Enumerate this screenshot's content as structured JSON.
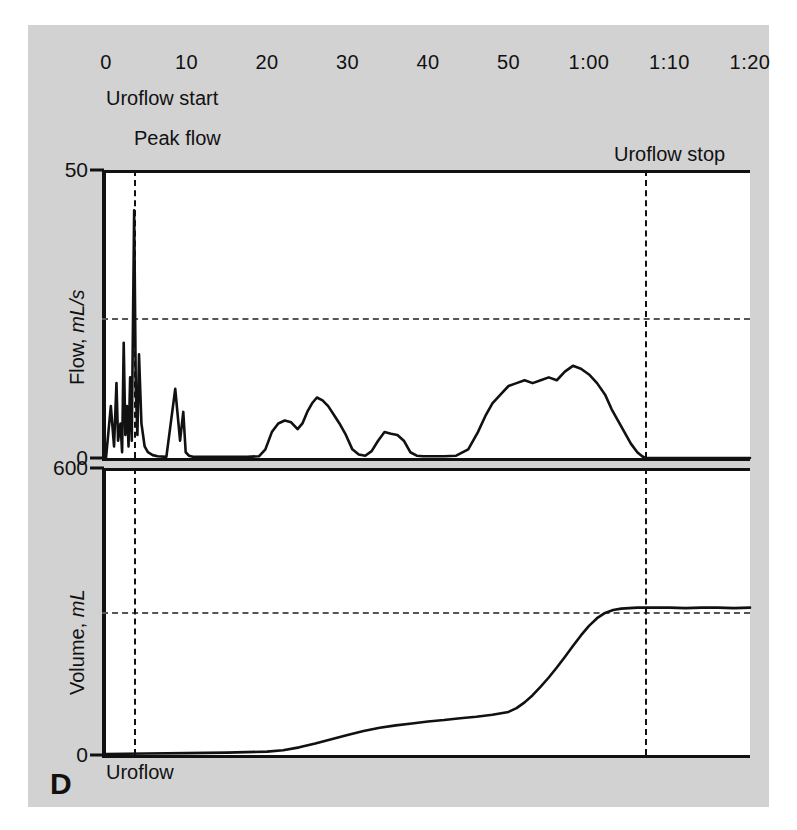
{
  "figure": {
    "panel_label": "D",
    "caption": "Uroflow",
    "background": "#d2d2d2",
    "plot_background": "#ffffff",
    "trace_color": "#111111"
  },
  "annotations": [
    {
      "name": "uroflow-start",
      "text": "Uroflow start",
      "time_s": 0
    },
    {
      "name": "peak-flow",
      "text": "Peak flow",
      "time_s": 3.5
    },
    {
      "name": "uroflow-stop",
      "text": "Uroflow stop",
      "time_s": 67
    }
  ],
  "chart_data": {
    "type": "line",
    "title": "Uroflow",
    "panel": "D",
    "xlabel": "",
    "x_tick_labels": [
      "0",
      "10",
      "20",
      "30",
      "40",
      "50",
      "1:00",
      "1:10",
      "1:20"
    ],
    "x_tick_values": [
      0,
      10,
      20,
      30,
      40,
      50,
      60,
      70,
      80
    ],
    "xlim": [
      0,
      80
    ],
    "grid": true,
    "legend": "none",
    "subplots": [
      {
        "name": "flow",
        "ylabel": "Flow, mL/s",
        "ylim": [
          0,
          50
        ],
        "y_tick_labels": [
          "50",
          "0"
        ],
        "y_tick_values": [
          50,
          0
        ],
        "gridlines_y": [
          25
        ],
        "units": "mL/s",
        "peak_flow_value": 43,
        "peak_flow_time_s": 3.5,
        "series": [
          {
            "name": "flow-rate",
            "x": [
              0,
              0.6,
              1.0,
              1.3,
              1.5,
              1.8,
              2.0,
              2.2,
              2.4,
              2.6,
              2.8,
              3.0,
              3.2,
              3.4,
              3.5,
              3.7,
              3.9,
              4.1,
              4.4,
              4.8,
              5.2,
              5.8,
              6.4,
              7.5,
              8.6,
              9.2,
              9.6,
              9.9,
              10.3,
              10.8,
              11.6,
              13.0,
              15.0,
              17.5,
              19.0,
              19.8,
              20.6,
              21.4,
              22.2,
              23.0,
              23.8,
              24.4,
              25.0,
              25.6,
              26.2,
              26.9,
              27.6,
              28.3,
              29.0,
              29.8,
              30.6,
              31.4,
              32.2,
              33.0,
              33.8,
              34.6,
              35.4,
              36.2,
              37.0,
              37.8,
              38.6,
              39.4,
              40.2,
              41.0,
              42.0,
              43.5,
              45.0,
              46.2,
              47.2,
              48.0,
              49.0,
              50.0,
              51.0,
              52.0,
              53.0,
              54.0,
              55.0,
              56.0,
              57.0,
              58.0,
              59.0,
              60.0,
              61.0,
              62.0,
              62.8,
              63.6,
              64.4,
              65.2,
              66.0,
              66.6,
              67.0,
              70.0,
              75.0,
              80.0
            ],
            "y": [
              0,
              9,
              2,
              13,
              3,
              6,
              1,
              20,
              4,
              9,
              2,
              14,
              3,
              30,
              43,
              12,
              4,
              18,
              6,
              2,
              1,
              0.5,
              0.3,
              0.2,
              12,
              3,
              8,
              1,
              0.4,
              0.2,
              0.2,
              0.2,
              0.2,
              0.2,
              0.3,
              1.5,
              4.5,
              6.0,
              6.5,
              6.2,
              5.0,
              6.0,
              8.0,
              9.5,
              10.5,
              10.0,
              9.0,
              7.5,
              6.0,
              4.0,
              1.5,
              0.6,
              0.4,
              1.2,
              3.0,
              4.5,
              4.2,
              4.0,
              3.0,
              1.0,
              0.4,
              0.3,
              0.3,
              0.3,
              0.3,
              0.4,
              1.5,
              4.5,
              7.5,
              9.5,
              11.0,
              12.5,
              13.0,
              13.5,
              13.0,
              13.5,
              14.0,
              13.5,
              15.0,
              16.0,
              15.5,
              14.5,
              13.0,
              11.0,
              8.5,
              6.5,
              4.5,
              2.5,
              1.0,
              0.3,
              0,
              0,
              0,
              0
            ]
          }
        ]
      },
      {
        "name": "volume",
        "ylabel": "Volume, mL",
        "ylim": [
          0,
          600
        ],
        "y_tick_labels": [
          "600",
          "0"
        ],
        "y_tick_values": [
          600,
          0
        ],
        "gridlines_y": [
          300
        ],
        "units": "mL",
        "voided_volume": 305,
        "series": [
          {
            "name": "voided-volume",
            "x": [
              0,
              5,
              10,
              15,
              20,
              22,
              24,
              26,
              28,
              30,
              32,
              34,
              36,
              38,
              40,
              42,
              44,
              46,
              48,
              50,
              51,
              52,
              53,
              54,
              55,
              56,
              57,
              58,
              59,
              60,
              61,
              62,
              63,
              64,
              65,
              66,
              67,
              68,
              70,
              72,
              74,
              76,
              78,
              80
            ],
            "y": [
              2,
              3,
              4,
              5,
              7,
              10,
              16,
              24,
              33,
              42,
              50,
              57,
              62,
              66,
              70,
              73,
              77,
              80,
              84,
              90,
              98,
              110,
              125,
              143,
              162,
              183,
              205,
              228,
              250,
              270,
              286,
              297,
              303,
              306,
              307,
              308,
              308,
              308,
              308,
              307,
              308,
              308,
              307,
              308
            ]
          }
        ]
      }
    ]
  }
}
